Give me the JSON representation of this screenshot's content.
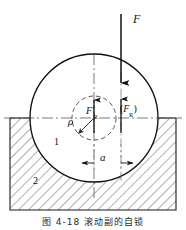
{
  "figure": {
    "caption": "图 4-18  滚动副的自锁",
    "labels": {
      "applied_force": "F",
      "reaction_force_prime": "F",
      "reaction_force_prime_sub": "R",
      "reaction_force_paren_open": "(",
      "reaction_force_paren": "F",
      "reaction_force_paren_sub": "R",
      "reaction_force_paren_close": ")",
      "friction_circle_radius": "ρ",
      "offset_distance": "a",
      "body_one": "1",
      "body_two": "2"
    },
    "colors": {
      "line": "#1a1a1a",
      "hatch": "#3a3a3a",
      "centerline": "#555555",
      "dashed": "#4a4a4a",
      "background": "#ffffff"
    },
    "geometry": {
      "circle_center_x": 94,
      "circle_center_y": 118,
      "circle_radius": 64,
      "friction_circle_radius": 22,
      "ground_top_y": 118,
      "ground_bottom_y": 210,
      "ground_left_x": 10,
      "ground_right_x": 176,
      "force_line_x": 121,
      "axis_line_x": 94,
      "dimension_y": 163
    }
  }
}
